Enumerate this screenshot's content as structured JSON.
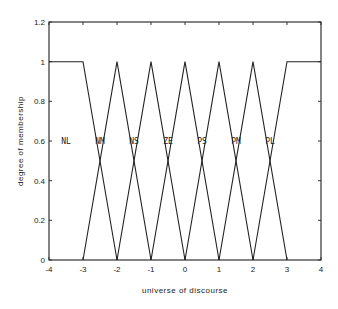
{
  "chart_data": {
    "type": "line",
    "title": "",
    "xlabel": "universe of discourse",
    "ylabel": "degree of membership",
    "xlim": [
      -4,
      4
    ],
    "ylim": [
      0,
      1.2
    ],
    "grid": false,
    "legend": "none (inline labels)",
    "x_ticks": [
      "-4",
      "-3",
      "-2",
      "-1",
      "0",
      "1",
      "2",
      "3",
      "4"
    ],
    "y_ticks": [
      "0",
      "0.2",
      "0.4",
      "0.6",
      "0.8",
      "1",
      "1.2"
    ],
    "series": [
      {
        "name": "NL",
        "x": [
          -4,
          -3,
          -2
        ],
        "y": [
          1,
          1,
          0
        ],
        "label_x": -3.5
      },
      {
        "name": "NM",
        "x": [
          -3,
          -2,
          -1
        ],
        "y": [
          0,
          1,
          0
        ],
        "label_x": -2.5
      },
      {
        "name": "NS",
        "x": [
          -2,
          -1,
          0
        ],
        "y": [
          0,
          1,
          0
        ],
        "label_x": -1.5
      },
      {
        "name": "ZE",
        "x": [
          -1,
          0,
          1
        ],
        "y": [
          0,
          1,
          0
        ],
        "label_x": -0.5
      },
      {
        "name": "PS",
        "x": [
          0,
          1,
          2
        ],
        "y": [
          0,
          1,
          0
        ],
        "label_x": 0.5
      },
      {
        "name": "PM",
        "x": [
          1,
          2,
          3
        ],
        "y": [
          0,
          1,
          0
        ],
        "label_x": 1.5
      },
      {
        "name": "PL",
        "x": [
          2,
          3,
          4
        ],
        "y": [
          0,
          1,
          1
        ],
        "label_x": 2.5
      }
    ],
    "label_y": 0.6
  }
}
